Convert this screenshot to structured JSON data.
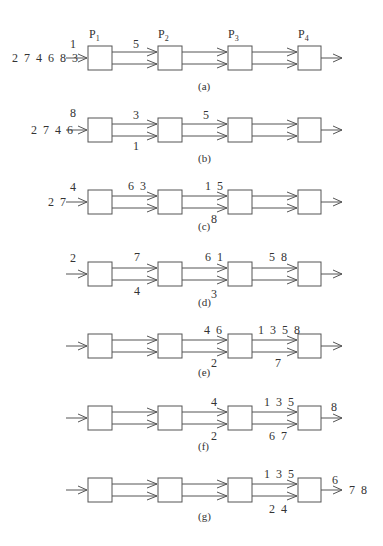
{
  "figure": {
    "processors": [
      "P1",
      "P2",
      "P3",
      "P4"
    ],
    "processor_labels": {
      "p1": {
        "main": "P",
        "sub": "1"
      },
      "p2": {
        "main": "P",
        "sub": "2"
      },
      "p3": {
        "main": "P",
        "sub": "3"
      },
      "p4": {
        "main": "P",
        "sub": "4"
      }
    },
    "panels": {
      "a": {
        "caption": "(a)",
        "input_queue": "2 7 4 6 8 3",
        "input_arrow": "1",
        "p1p2_top": "5",
        "p1p2_bottom": "",
        "p2p3_top": "",
        "p2p3_bottom": "",
        "p3p4_top": "",
        "p3p4_bottom": "",
        "output_arrow": "",
        "output_done": ""
      },
      "b": {
        "caption": "(b)",
        "input_queue": "2 7 4 6",
        "input_arrow": "8",
        "p1p2_top": "3",
        "p1p2_bottom": "1",
        "p2p3_top": "5",
        "p2p3_bottom": "",
        "p3p4_top": "",
        "p3p4_bottom": "",
        "output_arrow": "",
        "output_done": ""
      },
      "c": {
        "caption": "(c)",
        "input_queue": "2 7",
        "input_arrow": "4",
        "p1p2_top": "6 3",
        "p1p2_bottom": "",
        "p2p3_top": "1 5",
        "p2p3_bottom": "8",
        "p3p4_top": "",
        "p3p4_bottom": "",
        "output_arrow": "",
        "output_done": ""
      },
      "d": {
        "caption": "(d)",
        "input_queue": "",
        "input_arrow": "2",
        "p1p2_top": "7",
        "p1p2_bottom": "4",
        "p2p3_top": "6 1",
        "p2p3_bottom": "3",
        "p3p4_top": "5 8",
        "p3p4_bottom": "",
        "output_arrow": "",
        "output_done": ""
      },
      "e": {
        "caption": "(e)",
        "input_queue": "",
        "input_arrow": "",
        "p1p2_top": "",
        "p1p2_bottom": "",
        "p2p3_top": "4 6",
        "p2p3_bottom": "2",
        "p3p4_top": "1 3 5 8",
        "p3p4_bottom": "7",
        "output_arrow": "",
        "output_done": ""
      },
      "f": {
        "caption": "(f)",
        "input_queue": "",
        "input_arrow": "",
        "p1p2_top": "",
        "p1p2_bottom": "",
        "p2p3_top": "4",
        "p2p3_bottom": "2",
        "p3p4_top": "1 3 5",
        "p3p4_bottom": "6 7",
        "output_arrow": "8",
        "output_done": ""
      },
      "g": {
        "caption": "(g)",
        "input_queue": "",
        "input_arrow": "",
        "p1p2_top": "",
        "p1p2_bottom": "",
        "p2p3_top": "",
        "p2p3_bottom": "",
        "p3p4_top": "1 3 5",
        "p3p4_bottom": "2 4",
        "output_arrow": "6",
        "output_done": "7 8"
      }
    }
  }
}
